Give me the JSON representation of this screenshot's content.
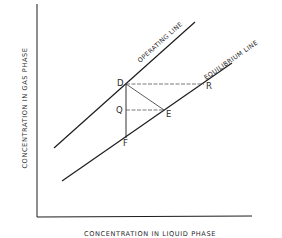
{
  "diagram": {
    "type": "mass-transfer operating/equilibrium line diagram",
    "colors": {
      "line": "#1c1c1c",
      "text": "#2a2a2a",
      "dashed": "#555555",
      "background": "#ffffff"
    },
    "axes": {
      "x_label": "CONCENTRATION IN LIQUID PHASE",
      "y_label": "CONCENTRATION IN GAS PHASE"
    },
    "lines": {
      "operating": {
        "label": "OPERATING LINE"
      },
      "equilibrium": {
        "label": "EQUILIBRIUM LINE"
      }
    },
    "points": {
      "D": "D",
      "R": "R",
      "Q": "Q",
      "E": "E",
      "F": "F"
    }
  }
}
